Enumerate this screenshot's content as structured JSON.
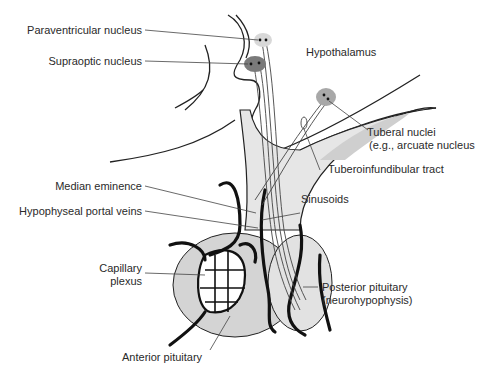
{
  "figure": {
    "colors": {
      "background": "#ffffff",
      "tissue_light": "#e6e6e6",
      "tissue_mid": "#cfcfcf",
      "nucleus_light": "#d8d8d8",
      "nucleus_dark": "#7a7a7a",
      "nucleus_mid": "#a8a8a8",
      "vessel": "#111111",
      "outline": "#222222",
      "leader": "#444444",
      "text": "#2a2a2a"
    }
  },
  "labels": {
    "paraventricular": "Paraventricular nucleus",
    "supraoptic": "Supraoptic nucleus",
    "hypothalamus": "Hypothalamus",
    "tuberal_1": "Tuberal nuclei",
    "tuberal_2": "(e.g., arcuate nucleus",
    "tuberoinfundibular": "Tuberoinfundibular tract",
    "median_eminence": "Median eminence",
    "sinusoids": "Sinusoids",
    "portal_veins": "Hypophyseal portal veins",
    "capillary_1": "Capillary",
    "capillary_2": "plexus",
    "posterior_1": "Posterior pituitary",
    "posterior_2": "(neurohypophysis)",
    "anterior": "Anterior pituitary"
  }
}
